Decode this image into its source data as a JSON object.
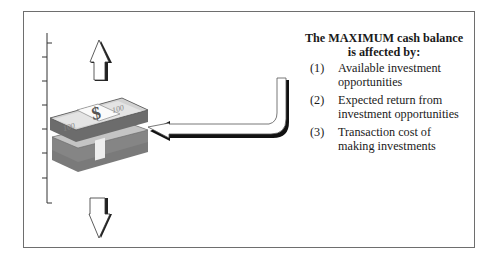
{
  "figure": {
    "heading_line1": "The MAXIMUM cash balance",
    "heading_line2": "is affected by:",
    "factors": [
      {
        "number": "(1)",
        "line1": "Available investment",
        "line2": "opportunities"
      },
      {
        "number": "(2)",
        "line1": "Expected return from",
        "line2": "investment opportunities"
      },
      {
        "number": "(3)",
        "line1": "Transaction cost of",
        "line2": "making investments"
      }
    ],
    "money_stack": {
      "bill_label": "100",
      "band_symbol": "$"
    },
    "icons": [
      "up-arrow-icon",
      "down-arrow-icon",
      "curved-arrow-icon",
      "money-stack-icon"
    ]
  }
}
